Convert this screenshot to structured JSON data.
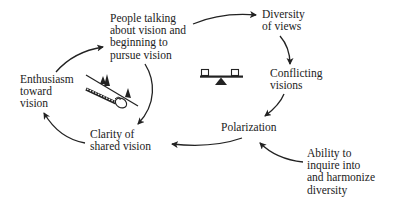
{
  "diagram": {
    "type": "causal-loop",
    "nodes": [
      {
        "id": "people_talking",
        "lines": [
          "People talking",
          "about vision and",
          "beginning to",
          "pursue vision"
        ]
      },
      {
        "id": "diversity",
        "lines": [
          "Diversity",
          "of views"
        ]
      },
      {
        "id": "conflicting",
        "lines": [
          "Conflicting",
          "visions"
        ]
      },
      {
        "id": "polarization",
        "lines": [
          "Polarization"
        ]
      },
      {
        "id": "ability",
        "lines": [
          "Ability to",
          "inquire into",
          "and harmonize",
          "diversity"
        ]
      },
      {
        "id": "clarity",
        "lines": [
          "Clarity of",
          "shared vision"
        ]
      },
      {
        "id": "enthusiasm",
        "lines": [
          "Enthusiasm",
          "toward",
          "vision"
        ]
      }
    ],
    "edges": [
      {
        "from": "people_talking",
        "to": "diversity"
      },
      {
        "from": "diversity",
        "to": "conflicting"
      },
      {
        "from": "conflicting",
        "to": "polarization"
      },
      {
        "from": "polarization",
        "to": "clarity"
      },
      {
        "from": "ability",
        "to": "polarization"
      },
      {
        "from": "people_talking",
        "to": "clarity"
      },
      {
        "from": "clarity",
        "to": "enthusiasm"
      },
      {
        "from": "enthusiasm",
        "to": "people_talking"
      }
    ],
    "icons": [
      {
        "name": "balance-scale-icon",
        "meaning": "balancing loop"
      },
      {
        "name": "snowball-slope-icon",
        "meaning": "reinforcing loop"
      }
    ],
    "colors": {
      "ink": "#222222",
      "background": "#ffffff"
    }
  }
}
